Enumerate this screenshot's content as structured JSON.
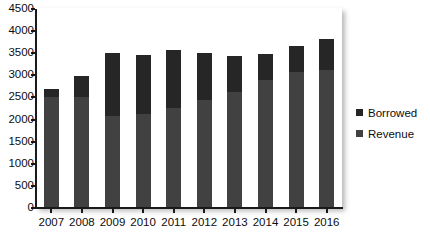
{
  "chart_data": {
    "type": "bar",
    "title": "",
    "subtitle": "",
    "xlabel": "",
    "ylabel": "",
    "stacked": true,
    "grid": false,
    "legend_position": "right",
    "categories": [
      "2007",
      "2008",
      "2009",
      "2010",
      "2011",
      "2012",
      "2013",
      "2014",
      "2015",
      "2016"
    ],
    "series": [
      {
        "name": "Revenue",
        "color": "#414141",
        "values": [
          2500,
          2500,
          2070,
          2120,
          2250,
          2440,
          2620,
          2900,
          3070,
          3120
        ]
      },
      {
        "name": "Borrowed",
        "color": "#262626",
        "values": [
          200,
          480,
          1430,
          1330,
          1330,
          1070,
          820,
          580,
          600,
          710
        ]
      }
    ],
    "totals": [
      2700,
      2980,
      3500,
      3450,
      3580,
      3510,
      3440,
      3480,
      3670,
      3830
    ],
    "ylim": [
      0,
      4500
    ],
    "ytick_values": [
      0,
      500,
      1000,
      1500,
      2000,
      2500,
      3000,
      3500,
      4000,
      4500
    ],
    "ytick_labels": [
      "0",
      "500",
      "1000",
      "1500",
      "2000",
      "2500",
      "3000",
      "3500",
      "4000",
      "4500"
    ]
  },
  "legend": {
    "items": [
      {
        "label": "Borrowed",
        "color": "#262626"
      },
      {
        "label": "Revenue",
        "color": "#414141"
      }
    ]
  }
}
